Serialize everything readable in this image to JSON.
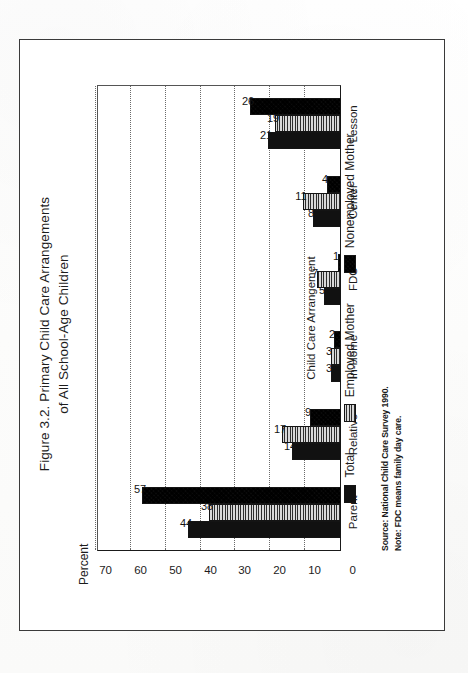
{
  "figure": {
    "title_line1": "Figure 3.2. Primary Child Care Arrangements",
    "title_line2": "of All School-Age Children",
    "ylabel": "Percent",
    "xlabel": "Child Care Arrangement",
    "source_note": "Source: National Child Care Survey 1990.",
    "definition_note": "Note: FDC means family day care."
  },
  "legend": {
    "position": "below-axis",
    "entries": [
      {
        "label": "Total",
        "pattern": "solid-black",
        "color": "#111111"
      },
      {
        "label": "Employed Mother",
        "pattern": "horizontal-stripe-light",
        "color": "#d8d8d8"
      },
      {
        "label": "Nonemployed Mother",
        "pattern": "diagonal-crosshatch-dark",
        "color": "#222222"
      }
    ]
  },
  "axis": {
    "y_ticks": [
      "70",
      "60",
      "50",
      "40",
      "30",
      "20",
      "10",
      "0"
    ],
    "y_min": 0,
    "y_max": 70,
    "grid": true
  },
  "chart_data": {
    "type": "bar",
    "title": "Figure 3.2. Primary Child Care Arrangements of All School-Age Children",
    "xlabel": "Child Care Arrangement",
    "ylabel": "Percent",
    "ylim": [
      0,
      70
    ],
    "yticks": [
      0,
      10,
      20,
      30,
      40,
      50,
      60,
      70
    ],
    "grid": true,
    "legend_position": "bottom",
    "orientation": "vertical-grouped",
    "categories": [
      "Parent",
      "Relative",
      "In-Home",
      "FDC",
      "Center",
      "Lesson"
    ],
    "series": [
      {
        "name": "Total",
        "values": [
          44,
          14,
          3,
          5,
          8,
          21
        ]
      },
      {
        "name": "Employed Mother",
        "values": [
          38,
          17,
          3,
          7,
          11,
          19
        ]
      },
      {
        "name": "Nonemployed Mother",
        "values": [
          57,
          9,
          2,
          1,
          4,
          26
        ]
      }
    ],
    "data_labels": [
      {
        "category": "Parent",
        "Total": "44",
        "Employed Mother": "38",
        "Nonemployed Mother": "57"
      },
      {
        "category": "Relative",
        "Total": "14",
        "Employed Mother": "17",
        "Nonemployed Mother": "9"
      },
      {
        "category": "In-Home",
        "Total": "3",
        "Employed Mother": "3",
        "Nonemployed Mother": "2"
      },
      {
        "category": "FDC",
        "Total": "5",
        "Employed Mother": "7",
        "Nonemployed Mother": "1"
      },
      {
        "category": "Center",
        "Total": "8",
        "Employed Mother": "11",
        "Nonemployed Mother": "4"
      },
      {
        "category": "Lesson",
        "Total": "21",
        "Employed Mother": "19",
        "Nonemployed Mother": "26"
      }
    ],
    "source": "National Child Care Survey 1990.",
    "annotations": [
      "Note: FDC means family day care."
    ]
  }
}
